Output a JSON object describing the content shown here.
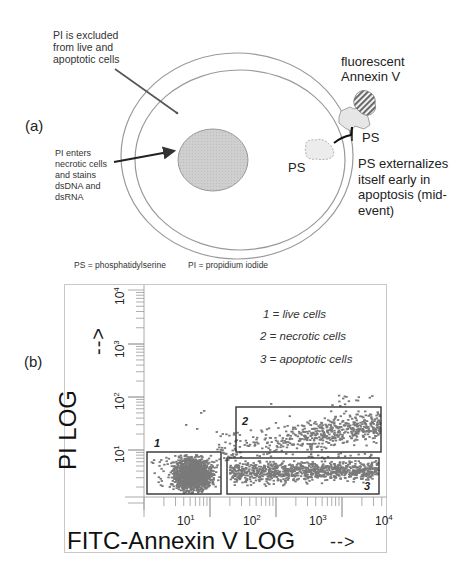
{
  "panel_a": {
    "label": "(a)",
    "text_pi_excluded": [
      "PI is excluded",
      "from live and",
      "apoptotic cells"
    ],
    "text_pi_enters": [
      "PI enters",
      "necrotic cells",
      "and stains",
      "dsDNA and",
      "dsRNA"
    ],
    "text_fluorescent": [
      "fluorescent",
      "Annexin V"
    ],
    "text_ps_outer": "PS",
    "text_ps_inner": "PS",
    "text_ps_externalizes": [
      "PS externalizes",
      "itself early in",
      "apoptosis  (mid-",
      "event)"
    ],
    "footnote_ps": "PS = phosphatidylserine",
    "footnote_pi": "PI = propidium iodide",
    "colors": {
      "nucleus": "#c8c8c8",
      "membrane": "#9a9a9a",
      "annexin": "#6a6a6a",
      "ps": "#e6e6e6"
    }
  },
  "panel_b": {
    "label": "(b)",
    "y_axis_title": "PI LOG",
    "y_axis_arrow": "-->",
    "x_axis_title": "FITC-Annexin V LOG",
    "x_axis_arrow": "-->",
    "y_ticks": [
      {
        "base": "10",
        "exp": "4"
      },
      {
        "base": "10",
        "exp": "3"
      },
      {
        "base": "10",
        "exp": "2"
      },
      {
        "base": "10",
        "exp": "1"
      }
    ],
    "x_ticks": [
      {
        "base": "10",
        "exp": "1"
      },
      {
        "base": "10",
        "exp": "2"
      },
      {
        "base": "10",
        "exp": "3"
      },
      {
        "base": "10",
        "exp": "4"
      }
    ],
    "legend": [
      "1 = live cells",
      "2 = necrotic cells",
      "3 = apoptotic cells"
    ],
    "gates": [
      {
        "id": "1",
        "name": "live cells"
      },
      {
        "id": "2",
        "name": "necrotic cells"
      },
      {
        "id": "3",
        "name": "apoptotic cells"
      }
    ],
    "colors": {
      "dots": "#7a7a7a",
      "gate": "#333333",
      "axis": "#aaaaaa"
    }
  },
  "chart_data": {
    "type": "scatter",
    "title": "",
    "xlabel": "FITC-Annexin V LOG",
    "ylabel": "PI LOG",
    "xscale": "log",
    "yscale": "log",
    "xlim": [
      1,
      10000
    ],
    "ylim": [
      1,
      10000
    ],
    "x_tick_labels": [
      "10^1",
      "10^2",
      "10^3",
      "10^4"
    ],
    "y_tick_labels": [
      "10^1",
      "10^2",
      "10^3",
      "10^4"
    ],
    "legend": [
      "1 = live cells",
      "2 = necrotic cells",
      "3 = apoptotic cells"
    ],
    "gates": [
      {
        "label": "1",
        "population": "live cells",
        "x_range": [
          1.5,
          15
        ],
        "y_range": [
          1,
          10
        ],
        "density": "very high"
      },
      {
        "label": "2",
        "population": "necrotic cells",
        "x_range": [
          40,
          20000
        ],
        "y_range": [
          10,
          60
        ],
        "density": "medium, increasing toward high x"
      },
      {
        "label": "3",
        "population": "apoptotic cells",
        "x_range": [
          30,
          18000
        ],
        "y_range": [
          1,
          8
        ],
        "density": "high"
      }
    ]
  }
}
